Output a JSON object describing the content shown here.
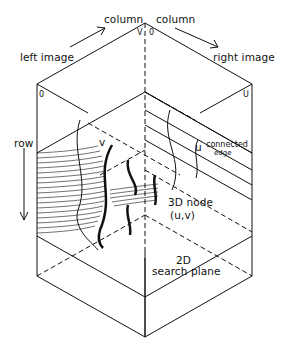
{
  "diagram": {
    "type": "isometric-search-volume",
    "labels": {
      "column_left": "column",
      "column_right": "column",
      "left_image": "left image",
      "right_image": "right image",
      "v_top": "V",
      "zero_top": "0",
      "zero_left": "0",
      "u_right": "U",
      "row": "row",
      "v_inner": "v",
      "u_inner": "u",
      "connected_edge_line1": "connected",
      "connected_edge_line2": "edge",
      "node_line1": "3D node",
      "node_line2": "(u,v)",
      "plane_line1": "2D",
      "plane_line2": "search plane"
    },
    "colors": {
      "ink": "#111111",
      "background": "#ffffff"
    }
  }
}
